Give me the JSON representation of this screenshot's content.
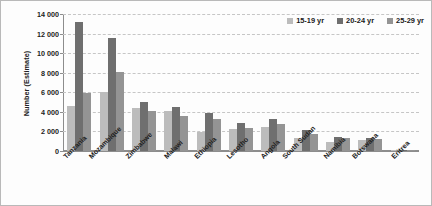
{
  "chart_data": {
    "type": "bar",
    "title": "",
    "xlabel": "",
    "ylabel": "Number (Estimate)",
    "ylim": [
      0,
      14000
    ],
    "ytick_values": [
      0,
      2000,
      4000,
      6000,
      8000,
      10000,
      12000,
      14000
    ],
    "ytick_labels": [
      "0",
      "2 000",
      "4 000",
      "6 000",
      "8 000",
      "10 000",
      "12 000",
      "14 000"
    ],
    "grid": true,
    "legend_position": "top-right",
    "categories": [
      "Tanzania",
      "Mozambique",
      "Zimbabwe",
      "Malawi",
      "Ethiopia",
      "Lesotho",
      "Angola",
      "South Sudan",
      "Namibia",
      "Botswana",
      "Eritrea"
    ],
    "series": [
      {
        "name": "15-19 yr",
        "color": "#bcbcbc",
        "values": [
          4600,
          6000,
          4400,
          4050,
          1950,
          2300,
          2450,
          1300,
          950,
          1150,
          120
        ]
      },
      {
        "name": "20-24 yr",
        "color": "#6f6f6f",
        "values": [
          13200,
          11500,
          5050,
          4500,
          3900,
          2900,
          3250,
          2150,
          1400,
          1300,
          150
        ]
      },
      {
        "name": "25-29 yr",
        "color": "#949494",
        "values": [
          5900,
          8100,
          4100,
          3550,
          3300,
          2400,
          2800,
          1750,
          1300,
          1200,
          110
        ]
      }
    ]
  },
  "legend": {
    "items": [
      {
        "label": "15-19 yr",
        "color": "#bcbcbc"
      },
      {
        "label": "20-24 yr",
        "color": "#6f6f6f"
      },
      {
        "label": "25-29 yr",
        "color": "#949494"
      }
    ]
  }
}
